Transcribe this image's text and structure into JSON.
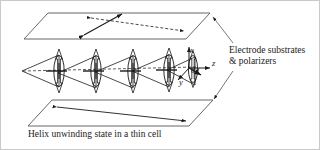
{
  "figure": {
    "title_caption": "Helix unwinding state in a thin cell",
    "annotation": {
      "line1": "Electrode substrates",
      "line2": "& polarizers"
    },
    "axes": {
      "x_label": "x",
      "y_label": "y",
      "z_label": "z",
      "angle_label": "θ"
    },
    "colors": {
      "stroke": "#1a1a1a",
      "plane_stroke": "#555555",
      "background": "#ffffff",
      "border": "#c9c9c9"
    },
    "elements": {
      "top_plane_name": "electrode substrate top plane",
      "bottom_plane_name": "electrode substrate bottom plane",
      "director_units_count": 5
    }
  }
}
